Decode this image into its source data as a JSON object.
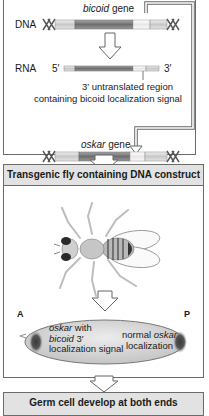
{
  "top_panel": {
    "bicoid_label_italic": "bicoid",
    "bicoid_label_rest": " gene",
    "dna_label": "DNA",
    "rna_label": "RNA",
    "rna_5prime": "5′",
    "rna_3prime": "3′",
    "utr_line1": "3′ untranslated region",
    "utr_line2": "containing bicoid localization signal",
    "oskar_label_italic": "oskar",
    "oskar_label_rest": " gene"
  },
  "banner1": {
    "text": "Transgenic fly containing DNA construct"
  },
  "middle_panel": {
    "anterior_label": "A",
    "posterior_label": "P",
    "left_text_line1_italic": "oskar",
    "left_text_line1_rest": " with",
    "left_text_line2_italic": "bicoid",
    "left_text_line2_rest": " 3′",
    "left_text_line3": "localization signal",
    "right_text_line1_plain": "normal ",
    "right_text_line1_italic": "oskar",
    "right_text_line2": "localization"
  },
  "banner2": {
    "text": "Germ cell develop at both ends"
  },
  "colors": {
    "gene_dark": "#7d7d7d",
    "gene_light": "#d6d6d6",
    "utr_white": "#f2f2f2",
    "banner_bg": "#e2e2e2",
    "egg_fill": "#dcdcdc",
    "pole_dark": "#4a4a4a"
  }
}
